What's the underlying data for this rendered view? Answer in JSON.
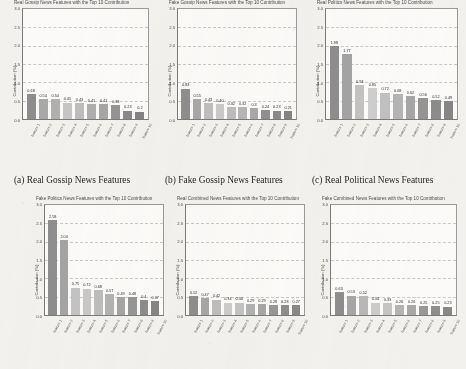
{
  "figure": {
    "background_color": "#f2f1ee",
    "panel_color": "#fbfaf8",
    "captions": [
      {
        "id": "a",
        "text": "(a) Real Gossip News Features"
      },
      {
        "id": "b",
        "text": "(b) Fake Gossip News Features"
      },
      {
        "id": "c",
        "text": "(c) Real Political News Features"
      }
    ]
  },
  "chart_data": [
    {
      "type": "bar",
      "title": "Real Gossip News Features with the Top 10 Contribution",
      "xlabel": "",
      "ylabel": "Contribution (%)",
      "ylim": [
        0.0,
        3.0
      ],
      "yticks": [
        "0.0",
        "0.5",
        "1.0",
        "1.5",
        "2.0",
        "2.5",
        "3.0"
      ],
      "grid": true,
      "legend": "none",
      "categories": [
        "feature 1",
        "feature 2",
        "feature 3",
        "feature 4",
        "feature 5",
        "feature 6",
        "feature 7",
        "feature 8",
        "feature 9",
        "feature 10"
      ],
      "values": [
        0.68,
        0.54,
        0.54,
        0.45,
        0.43,
        0.41,
        0.41,
        0.38,
        0.23,
        0.2
      ],
      "value_labels": [
        "0.68",
        "0.54",
        "0.54",
        "0.45",
        "0.43",
        "0.41",
        "0.41",
        "0.38",
        "0.23",
        "0.2"
      ],
      "bar_colors": [
        "#8e8e8e",
        "#a8a8a8",
        "#b0b0b0",
        "#c6c6c6",
        "#bdbdbd",
        "#aeaeae",
        "#a6a6a6",
        "#949494",
        "#8a8a8a",
        "#828282"
      ]
    },
    {
      "type": "bar",
      "title": "Fake Gossip News Features with the Top 10 Contribution",
      "xlabel": "",
      "ylabel": "Contribution (%)",
      "ylim": [
        0.0,
        3.0
      ],
      "yticks": [
        "0.0",
        "0.5",
        "1.0",
        "1.5",
        "2.0",
        "2.5",
        "3.0"
      ],
      "grid": true,
      "legend": "none",
      "categories": [
        "feature 1",
        "feature 2",
        "feature 3",
        "feature 4",
        "feature 5",
        "feature 6",
        "feature 7",
        "feature 8",
        "feature 9",
        "feature 10"
      ],
      "values": [
        0.83,
        0.55,
        0.43,
        0.4,
        0.32,
        0.32,
        0.3,
        0.24,
        0.23,
        0.21
      ],
      "value_labels": [
        "0.83",
        "0.55",
        "0.43",
        "0.40",
        "0.32",
        "0.32",
        "0.3",
        "0.24",
        "0.23",
        "0.21"
      ],
      "bar_colors": [
        "#8e8e8e",
        "#a8a8a8",
        "#bfbfbf",
        "#cacaca",
        "#bdbdbd",
        "#b6b6b6",
        "#a8a8a8",
        "#909090",
        "#8a8a8a",
        "#848484"
      ]
    },
    {
      "type": "bar",
      "title": "Real Politics News Features with the Top 10 Contribution",
      "xlabel": "",
      "ylabel": "Contribution (%)",
      "ylim": [
        0.0,
        3.0
      ],
      "yticks": [
        "0.0",
        "0.5",
        "1.0",
        "1.5",
        "2.0",
        "2.5",
        "3.0"
      ],
      "grid": true,
      "legend": "none",
      "categories": [
        "feature 1",
        "feature 2",
        "feature 3",
        "feature 4",
        "feature 5",
        "feature 6",
        "feature 7",
        "feature 8",
        "feature 9",
        "feature 10"
      ],
      "values": [
        1.98,
        1.77,
        0.93,
        0.85,
        0.72,
        0.68,
        0.62,
        0.56,
        0.52,
        0.49
      ],
      "value_labels": [
        "1.98",
        "1.77",
        "0.93",
        "0.85",
        "0.72",
        "0.68",
        "0.62",
        "0.56",
        "0.52",
        "0.49"
      ],
      "bar_colors": [
        "#8e8e8e",
        "#a4a4a4",
        "#c2c2c2",
        "#cdcdcd",
        "#c0c0c0",
        "#b4b4b4",
        "#a6a6a6",
        "#949494",
        "#8c8c8c",
        "#868686"
      ]
    },
    {
      "type": "bar",
      "title": "Fake Politics News Features with the Top 10 Contribution",
      "xlabel": "",
      "ylabel": "Contribution (%)",
      "ylim": [
        0.0,
        3.0
      ],
      "yticks": [
        "0.0",
        "0.5",
        "1.0",
        "1.5",
        "2.0",
        "2.5",
        "3.0"
      ],
      "grid": true,
      "legend": "none",
      "categories": [
        "feature 1",
        "feature 2",
        "feature 3",
        "feature 4",
        "feature 5",
        "feature 6",
        "feature 7",
        "feature 8",
        "feature 9",
        "feature 10"
      ],
      "values": [
        2.58,
        2.04,
        0.75,
        0.72,
        0.68,
        0.57,
        0.49,
        0.48,
        0.4,
        0.37
      ],
      "value_labels": [
        "2.58",
        "2.04",
        "0.75",
        "0.72",
        "0.68",
        "0.57",
        "0.49",
        "0.48",
        "0.4",
        "0.37"
      ],
      "bar_colors": [
        "#8e8e8e",
        "#a4a4a4",
        "#c2c2c2",
        "#c8c8c8",
        "#bdbdbd",
        "#b2b2b2",
        "#a4a4a4",
        "#969696",
        "#8c8c8c",
        "#868686"
      ]
    },
    {
      "type": "bar",
      "title": "Real Combined News Features with the Top 10 Contribution",
      "xlabel": "",
      "ylabel": "Contribution (%)",
      "ylim": [
        0.0,
        3.0
      ],
      "yticks": [
        "0.0",
        "0.5",
        "1.0",
        "1.5",
        "2.0",
        "2.5",
        "3.0"
      ],
      "grid": true,
      "legend": "none",
      "categories": [
        "feature 1",
        "feature 2",
        "feature 3",
        "feature 4",
        "feature 5",
        "feature 6",
        "feature 7",
        "feature 8",
        "feature 9",
        "feature 10"
      ],
      "values": [
        0.52,
        0.47,
        0.42,
        0.34,
        0.34,
        0.29,
        0.29,
        0.28,
        0.28,
        0.27
      ],
      "value_labels": [
        "0.52",
        "0.47",
        "0.42",
        "0.34",
        "0.34",
        "0.29",
        "0.29",
        "0.28",
        "0.28",
        "0.27"
      ],
      "bar_colors": [
        "#8e8e8e",
        "#a6a6a6",
        "#bcbcbc",
        "#cbcbcb",
        "#c4c4c4",
        "#b2b2b2",
        "#a6a6a6",
        "#969696",
        "#8e8e8e",
        "#888888"
      ]
    },
    {
      "type": "bar",
      "title": "Fake Combined News Features with the Top 10 Contribution",
      "xlabel": "",
      "ylabel": "Contribution (%)",
      "ylim": [
        0.0,
        3.0
      ],
      "yticks": [
        "0.0",
        "0.5",
        "1.0",
        "1.5",
        "2.0",
        "2.5",
        "3.0"
      ],
      "grid": true,
      "legend": "none",
      "categories": [
        "feature 1",
        "feature 2",
        "feature 3",
        "feature 4",
        "feature 5",
        "feature 6",
        "feature 7",
        "feature 8",
        "feature 9",
        "feature 10"
      ],
      "values": [
        0.63,
        0.53,
        0.52,
        0.34,
        0.33,
        0.26,
        0.26,
        0.25,
        0.25,
        0.23
      ],
      "value_labels": [
        "0.63",
        "0.53",
        "0.52",
        "0.34",
        "0.33",
        "0.26",
        "0.26",
        "0.25",
        "0.25",
        "0.23"
      ],
      "bar_colors": [
        "#8e8e8e",
        "#a6a6a6",
        "#b8b8b8",
        "#cbcbcb",
        "#c4c4c4",
        "#b4b4b4",
        "#a8a8a8",
        "#989898",
        "#8e8e8e",
        "#888888"
      ]
    }
  ]
}
